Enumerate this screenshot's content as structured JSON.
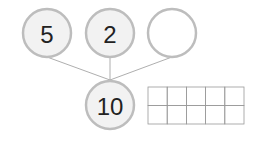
{
  "number_bond": {
    "parts": [
      {
        "label": "5"
      },
      {
        "label": "2"
      },
      {
        "label": ""
      }
    ],
    "whole": {
      "label": "10"
    }
  },
  "ten_frame": {
    "rows": 2,
    "columns": 5,
    "filled": 0
  }
}
